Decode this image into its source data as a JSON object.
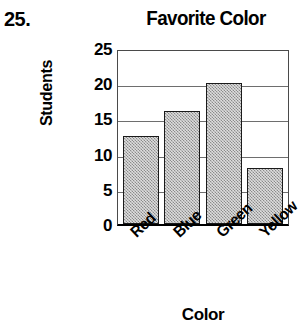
{
  "problem": {
    "number": "25."
  },
  "chart_data": {
    "type": "bar",
    "title": "Favorite Color",
    "xlabel": "Color",
    "ylabel": "Students",
    "categories": [
      "Red",
      "Blue",
      "Green",
      "Yellow"
    ],
    "values": [
      12.5,
      16,
      20,
      8
    ],
    "ylim": [
      0,
      25
    ],
    "ytick_labels": [
      "25",
      "20",
      "15",
      "10",
      "5",
      "0"
    ],
    "ytick_values": [
      25,
      20,
      15,
      10,
      5,
      0
    ],
    "grid": true,
    "legend": "none",
    "bar_fill_color": "#b4b4b4",
    "bar_border_color": "#1a1a1a",
    "axis_color": "#000000",
    "background_color": "#ffffff"
  }
}
